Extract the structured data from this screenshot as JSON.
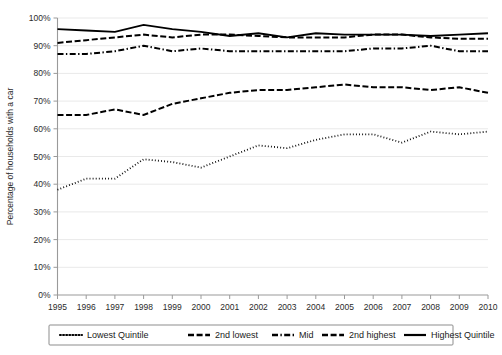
{
  "chart_data": {
    "type": "line",
    "title": "",
    "xlabel": "",
    "ylabel": "Percentage of households with a car",
    "categories": [
      "1995",
      "1996",
      "1997",
      "1998",
      "1999",
      "2000",
      "2001",
      "2002",
      "2003",
      "2004",
      "2005",
      "2006",
      "2007",
      "2008",
      "2009",
      "2010"
    ],
    "x": [
      1995,
      1996,
      1997,
      1998,
      1999,
      2000,
      2001,
      2002,
      2003,
      2004,
      2005,
      2006,
      2007,
      2008,
      2009,
      2010
    ],
    "ylim": [
      0,
      100
    ],
    "xlim": [
      1995,
      2010
    ],
    "ytick_labels": [
      "0%",
      "10%",
      "20%",
      "30%",
      "40%",
      "50%",
      "60%",
      "70%",
      "80%",
      "90%",
      "100%"
    ],
    "ytick_values": [
      0,
      10,
      20,
      30,
      40,
      50,
      60,
      70,
      80,
      90,
      100
    ],
    "grid": "horizontal",
    "legend_position": "bottom",
    "series": [
      {
        "name": "Lowest Quintile",
        "style": "dotted",
        "color": "#000000",
        "values": [
          38,
          42,
          42,
          49,
          48,
          46,
          50,
          54,
          53,
          56,
          58,
          58,
          55,
          59,
          58,
          59
        ]
      },
      {
        "name": "2nd lowest",
        "style": "dashed",
        "color": "#000000",
        "values": [
          65,
          65,
          67,
          65,
          69,
          71,
          73,
          74,
          74,
          75,
          76,
          75,
          75,
          74,
          75,
          73
        ]
      },
      {
        "name": "Mid",
        "style": "dash-dot",
        "color": "#000000",
        "values": [
          87,
          87,
          88,
          90,
          88,
          89,
          88,
          88,
          88,
          88,
          88,
          89,
          89,
          90,
          88,
          88
        ]
      },
      {
        "name": "2nd highest",
        "style": "dashed",
        "color": "#000000",
        "values": [
          91,
          92,
          93,
          94,
          93,
          94,
          94,
          93.5,
          93,
          93,
          93,
          94,
          94,
          93,
          92.5,
          92.5
        ]
      },
      {
        "name": "Highest Quintile",
        "style": "solid",
        "color": "#000000",
        "values": [
          96,
          95.5,
          95,
          97.5,
          96,
          95,
          93.5,
          94.5,
          93,
          94.5,
          94,
          94,
          94,
          93.5,
          94,
          94.5
        ]
      }
    ]
  },
  "legend": {
    "items": [
      {
        "label": "Lowest Quintile"
      },
      {
        "label": "2nd lowest"
      },
      {
        "label": "Mid"
      },
      {
        "label": "2nd highest"
      },
      {
        "label": "Highest Quintile"
      }
    ]
  }
}
